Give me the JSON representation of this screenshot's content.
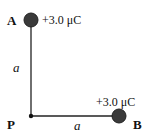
{
  "diagram": {
    "points": {
      "A": {
        "label": "A",
        "charge": "+3.0 μC"
      },
      "B": {
        "label": "B",
        "charge": "+3.0 μC"
      },
      "P": {
        "label": "P"
      }
    },
    "distances": {
      "PA": "a",
      "PB": "a"
    },
    "colors": {
      "charge_fill": "#3a3a3a",
      "line": "#222222"
    }
  }
}
